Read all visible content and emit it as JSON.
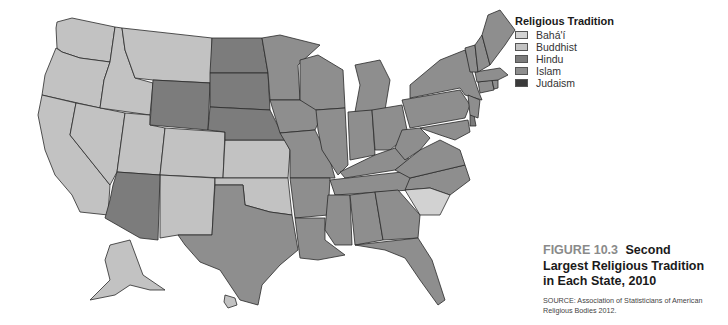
{
  "legend": {
    "title": "Religious Tradition",
    "items": [
      {
        "label": "Bahá'í",
        "color": "#d2d2d2"
      },
      {
        "label": "Buddhist",
        "color": "#c2c2c2"
      },
      {
        "label": "Hindu",
        "color": "#7c7c7c"
      },
      {
        "label": "Islam",
        "color": "#8e8e8e"
      },
      {
        "label": "Judaism",
        "color": "#3a3a3a"
      }
    ]
  },
  "caption": {
    "figure_number": "FIGURE 10.3",
    "title_part1": "Second",
    "title_part2": "Largest Religious Tradition",
    "title_part3": "in Each State, 2010",
    "source": "SOURCE: Association of Statisticians of American Religious Bodies 2012."
  },
  "map_data": {
    "title": "Second Largest Religious Tradition in Each State, 2010",
    "states": {
      "Washington": "Buddhist",
      "Oregon": "Buddhist",
      "California": "Buddhist",
      "Nevada": "Buddhist",
      "Idaho": "Buddhist",
      "Montana": "Buddhist",
      "Utah": "Buddhist",
      "Colorado": "Buddhist",
      "New Mexico": "Buddhist",
      "Kansas": "Buddhist",
      "Oklahoma": "Buddhist",
      "Alaska": "Buddhist",
      "Hawaii": "Buddhist",
      "South Carolina": "Bahá'í",
      "Arizona": "Hindu",
      "Wyoming": "Hindu",
      "North Dakota": "Hindu",
      "South Dakota": "Hindu",
      "Nebraska": "Hindu",
      "Delaware": "Hindu",
      "Texas": "Islam",
      "Minnesota": "Islam",
      "Iowa": "Islam",
      "Missouri": "Islam",
      "Arkansas": "Islam",
      "Louisiana": "Islam",
      "Wisconsin": "Islam",
      "Illinois": "Islam",
      "Michigan": "Islam",
      "Indiana": "Islam",
      "Ohio": "Islam",
      "Kentucky": "Islam",
      "Tennessee": "Islam",
      "Mississippi": "Islam",
      "Alabama": "Islam",
      "Georgia": "Islam",
      "Florida": "Islam",
      "North Carolina": "Islam",
      "Virginia": "Islam",
      "West Virginia": "Islam",
      "Maryland": "Islam",
      "Pennsylvania": "Islam",
      "New York": "Islam",
      "New Jersey": "Islam",
      "Connecticut": "Islam",
      "Rhode Island": "Islam",
      "Massachusetts": "Islam",
      "Vermont": "Islam",
      "New Hampshire": "Islam",
      "Maine": "Islam"
    }
  }
}
